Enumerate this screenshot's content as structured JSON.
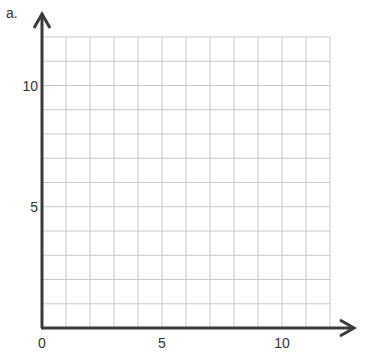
{
  "part_label": "a.",
  "chart_data": {
    "type": "scatter",
    "title": "",
    "xlabel": "",
    "ylabel": "",
    "xlim": [
      0,
      12
    ],
    "ylim": [
      0,
      12
    ],
    "grid": true,
    "grid_step": 1,
    "x_ticks": [
      {
        "value": 0,
        "label": "0"
      },
      {
        "value": 5,
        "label": "5"
      },
      {
        "value": 10,
        "label": "10"
      }
    ],
    "y_ticks": [
      {
        "value": 5,
        "label": "5"
      },
      {
        "value": 10,
        "label": "10"
      }
    ],
    "series": [],
    "colors": {
      "grid": "#c8c8c8",
      "axis": "#3a3a3a",
      "text": "#333333"
    }
  }
}
